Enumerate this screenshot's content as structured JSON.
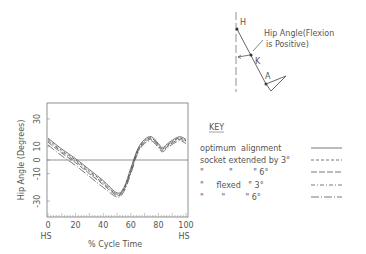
{
  "diagram": {
    "label_h": "H",
    "label_k": "K",
    "label_a": "A",
    "caption_line1": "Hip Angle(Flexion",
    "caption_line2": "is Positive)"
  },
  "chart_data": {
    "type": "line",
    "title": "",
    "xlabel": "% Cycle Time",
    "ylabel": "Hip Angle (Degrees)",
    "xlim": [
      0,
      100
    ],
    "ylim": [
      -40,
      40
    ],
    "x_ticks": [
      "0",
      "20",
      "40",
      "60",
      "80",
      "100"
    ],
    "x_tick_sublabels": {
      "0": "HS",
      "100": "HS"
    },
    "y_ticks": [
      "30",
      "10",
      "0",
      "-10",
      "-30"
    ],
    "grid": false,
    "zero_line": true,
    "legend_position": "right",
    "x": [
      0,
      10,
      20,
      30,
      40,
      50,
      55,
      60,
      65,
      70,
      75,
      80,
      83,
      88,
      95,
      100
    ],
    "series": [
      {
        "name": "optimum alignment",
        "dash": "",
        "values": [
          16,
          8,
          1,
          -7,
          -15,
          -24,
          -20,
          -6,
          8,
          15,
          17,
          12,
          9,
          13,
          17,
          15
        ]
      },
      {
        "name": "socket extended by 3°",
        "dash": "3,2",
        "values": [
          15,
          7,
          0,
          -8,
          -16,
          -25,
          -21,
          -7,
          7,
          14,
          16,
          11,
          8,
          12,
          16,
          14
        ]
      },
      {
        "name": "socket extended by 6°",
        "dash": "6,2",
        "values": [
          13,
          5,
          -2,
          -10,
          -18,
          -26,
          -22,
          -9,
          6,
          13,
          15,
          10,
          7,
          11,
          15,
          13
        ]
      },
      {
        "name": "socket flexed 3°",
        "dash": "4,2,1,2",
        "values": [
          14,
          6,
          -1,
          -9,
          -17,
          -25,
          -21,
          -8,
          7,
          14,
          16,
          11,
          8,
          12,
          16,
          14
        ]
      },
      {
        "name": "socket flexed 6°",
        "dash": "8,2,1,2",
        "values": [
          11,
          3,
          -4,
          -12,
          -20,
          -27,
          -23,
          -10,
          5,
          12,
          14,
          9,
          6,
          10,
          14,
          12
        ]
      }
    ]
  },
  "key": {
    "title": "KEY",
    "rows": [
      {
        "label": "optimum  alignment",
        "ditto": ""
      },
      {
        "label": "socket extended by 3°",
        "ditto": ""
      },
      {
        "label": "\"          \"        \" 6°",
        "ditto": ""
      },
      {
        "label": "\"     flexed   \" 3°",
        "ditto": ""
      },
      {
        "label": "\"       \"        \" 6°",
        "ditto": ""
      }
    ]
  }
}
